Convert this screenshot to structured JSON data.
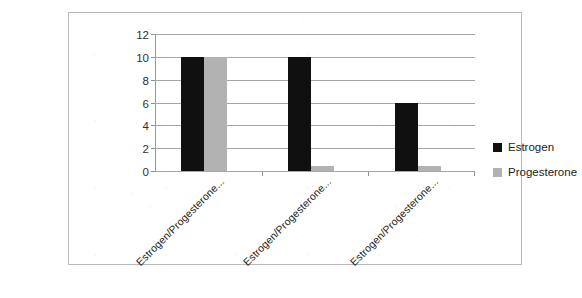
{
  "chart_data": {
    "type": "bar",
    "title": "",
    "subtitle": "",
    "xlabel": "",
    "ylabel": "",
    "ylim": [
      0,
      12
    ],
    "ytick_step": 2,
    "yticks": [
      "0",
      "2",
      "4",
      "6",
      "8",
      "10",
      "12"
    ],
    "grid": true,
    "grid_axis": "y",
    "legend_position": "right",
    "categories": [
      "Estrogen/Progesterone...",
      "Estrogen/Progesterone...",
      "Estrogen/Progesterone..."
    ],
    "category_label_rotation": -45,
    "series": [
      {
        "name": "Estrogen",
        "color": "#101010",
        "values": [
          10,
          10,
          6
        ]
      },
      {
        "name": "Progesterone",
        "color": "#b2b2b2",
        "values": [
          10,
          0.4,
          0.4
        ]
      }
    ]
  },
  "legend": {
    "items": [
      {
        "label": "Estrogen",
        "swatch": "series-estrogen"
      },
      {
        "label": "Progesterone",
        "swatch": "series-progesterone"
      }
    ]
  },
  "colors": {
    "estrogen": "#101010",
    "progesterone": "#b2b2b2",
    "gridline": "#a6a6a6",
    "axis": "#8f8f8f",
    "frame": "#b9b9b9",
    "text": "#242424",
    "background": "#ffffff"
  }
}
